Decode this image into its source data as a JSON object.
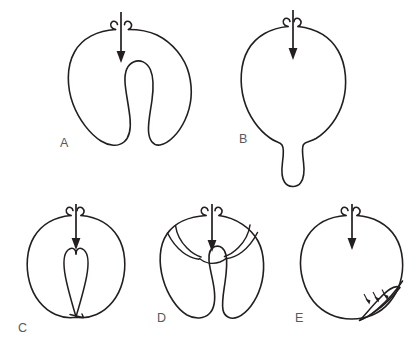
{
  "figure": {
    "type": "scientific-line-diagram",
    "background_color": "#ffffff",
    "stroke_color": "#231f20",
    "label_color": "#58595b",
    "width": 417,
    "height": 347,
    "panel_count": 5
  },
  "panels": [
    {
      "id": "A",
      "label": "A",
      "label_x": 60,
      "label_y": 147,
      "shape_name": "deep-invagination",
      "description": "Sphere with a deep U-shaped invagination pushed in from the top opening, producing two lateral lobes.",
      "arrow": {
        "name": "main-arrow",
        "direction": "down",
        "x": 121,
        "y_start": 12,
        "y_end": 63
      }
    },
    {
      "id": "B",
      "label": "B",
      "label_x": 239,
      "label_y": 143,
      "shape_name": "evagination-protrusion",
      "description": "Sphere with a finger-like protrusion extending downward from the bottom pole.",
      "arrow": {
        "name": "main-arrow",
        "direction": "down",
        "x": 293,
        "y_start": 10,
        "y_end": 60
      }
    },
    {
      "id": "C",
      "label": "C",
      "label_x": 18,
      "label_y": 332,
      "shape_name": "full-depth-invagination-loop",
      "description": "Sphere with a narrow teardrop invagination reaching all the way to the bottom wall.",
      "arrow": {
        "name": "main-arrow",
        "direction": "down",
        "x": 76,
        "y_start": 204,
        "y_end": 250
      }
    },
    {
      "id": "D",
      "label": "D",
      "label_x": 157,
      "label_y": 322,
      "shape_name": "compartmented-invagination",
      "description": "Sphere with an invagination whose cavity is subdivided by internal shoulder folds and a transverse roof arc.",
      "arrow": {
        "name": "main-arrow",
        "direction": "down",
        "x": 212,
        "y_start": 204,
        "y_end": 252
      }
    },
    {
      "id": "E",
      "label": "E",
      "label_x": 295,
      "label_y": 322,
      "shape_name": "tangential-sliver-fold",
      "description": "Sphere with a thin elongated lens-shaped fold along the lower-right inner wall, marked by three small arrows.",
      "arrow": {
        "name": "main-arrow",
        "direction": "down",
        "x": 352,
        "y_start": 204,
        "y_end": 250
      },
      "marker_arrows": {
        "name": "small-indicator-arrows",
        "count": 3,
        "direction": "down-right"
      }
    }
  ]
}
